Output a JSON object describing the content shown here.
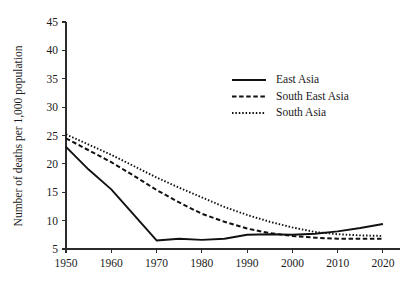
{
  "chart_data": {
    "type": "line",
    "title": "",
    "xlabel": "",
    "ylabel": "Number of deaths per 1,000 population",
    "xlim": [
      1950,
      2022
    ],
    "ylim": [
      5,
      45
    ],
    "xticks": [
      1950,
      1960,
      1970,
      1980,
      1990,
      2000,
      2010,
      2020
    ],
    "yticks": [
      5,
      10,
      15,
      20,
      25,
      30,
      35,
      40,
      45
    ],
    "xtick_labels": [
      "1950",
      "1960",
      "1970",
      "1980",
      "1990",
      "2000",
      "2010",
      "2020"
    ],
    "ytick_labels": [
      "5",
      "10",
      "15",
      "20",
      "25",
      "30",
      "35",
      "40",
      "45"
    ],
    "grid": false,
    "legend_position": "upper-center-right",
    "x": [
      1950,
      1955,
      1960,
      1965,
      1970,
      1975,
      1980,
      1985,
      1990,
      1995,
      2000,
      2005,
      2010,
      2015,
      2020
    ],
    "series": [
      {
        "name": "East Asia",
        "style": "solid",
        "color": "#111111",
        "values": [
          23.0,
          19.0,
          15.5,
          11.0,
          6.5,
          6.8,
          6.6,
          6.8,
          7.5,
          7.6,
          7.5,
          7.7,
          8.1,
          8.7,
          9.4
        ]
      },
      {
        "name": "South East Asia",
        "style": "dashed",
        "color": "#111111",
        "values": [
          24.5,
          22.4,
          20.3,
          17.9,
          15.4,
          13.2,
          11.2,
          9.8,
          8.6,
          7.8,
          7.3,
          7.0,
          6.8,
          6.8,
          6.8
        ]
      },
      {
        "name": "South Asia",
        "style": "dotted",
        "color": "#111111",
        "values": [
          25.2,
          23.4,
          21.6,
          19.6,
          17.6,
          15.8,
          14.1,
          12.4,
          11.0,
          9.8,
          8.8,
          8.0,
          7.6,
          7.4,
          7.3
        ]
      }
    ]
  },
  "legend": {
    "entries": [
      {
        "label": "East Asia",
        "style": "solid"
      },
      {
        "label": "South East Asia",
        "style": "dashed"
      },
      {
        "label": "South Asia",
        "style": "dotted"
      }
    ]
  },
  "colors": {
    "ink": "#111111",
    "axis": "#2b2b2b",
    "background": "#ffffff"
  }
}
